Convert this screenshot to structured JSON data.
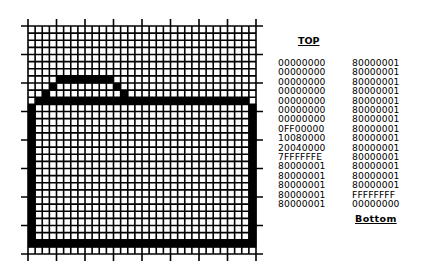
{
  "grid": {
    "columns": 32,
    "rows": 32,
    "tick_every": 4,
    "origin_x": 28,
    "origin_y": 26,
    "cell_size": 7.125,
    "line_color": "#000000",
    "fill_color": "#000000",
    "background": "#ffffff"
  },
  "labels": {
    "top": "TOP",
    "bottom": "Bottom"
  },
  "hex_rows": {
    "left_column": [
      "00000000",
      "00000000",
      "00000000",
      "00000000",
      "00000000",
      "00000000",
      "00000000",
      "0FF00000",
      "10080000",
      "20040000",
      "7FFFFFFE",
      "80000001",
      "80000001",
      "80000001",
      "80000001",
      "80000001"
    ],
    "right_column": [
      "80000001",
      "80000001",
      "80000001",
      "80000001",
      "80000001",
      "80000001",
      "80000001",
      "80000001",
      "80000001",
      "80000001",
      "80000001",
      "80000001",
      "80000001",
      "80000001",
      "FFFFFFFF",
      "00000000"
    ]
  },
  "icon": "folder-icon-bitmap"
}
